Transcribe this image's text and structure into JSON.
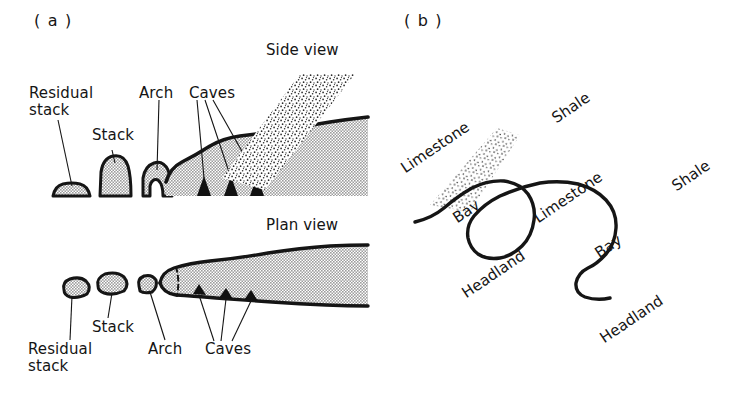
{
  "figure": {
    "background_color": "#ffffff",
    "ink_color": "#151515",
    "land_fill_color": "#b9b9b9",
    "shale_stipple_color": "#2b2b2b",
    "cave_color": "#111111"
  },
  "panels": [
    {
      "tag": "( a )",
      "title_top": "Side view",
      "title_bottom": "Plan view",
      "side_view": {
        "labels": [
          {
            "name": "residual-stack",
            "text_line1": "Residual",
            "text_line2": "stack"
          },
          {
            "name": "stack",
            "text_line1": "Stack",
            "text_line2": ""
          },
          {
            "name": "arch",
            "text_line1": "Arch",
            "text_line2": ""
          },
          {
            "name": "caves",
            "text_line1": "Caves",
            "text_line2": ""
          }
        ],
        "cave_count": 3
      },
      "plan_view": {
        "labels": [
          {
            "name": "residual-stack",
            "text_line1": "Residual",
            "text_line2": "stack"
          },
          {
            "name": "stack",
            "text_line1": "Stack",
            "text_line2": ""
          },
          {
            "name": "arch",
            "text_line1": "Arch",
            "text_line2": ""
          },
          {
            "name": "caves",
            "text_line1": "Caves",
            "text_line2": ""
          }
        ],
        "cave_count": 3
      }
    },
    {
      "tag": "( b )",
      "rock_labels": [
        {
          "name": "limestone-1",
          "text": "Limestone",
          "rotation_deg": -34
        },
        {
          "name": "shale-1",
          "text": "Shale",
          "rotation_deg": -34
        },
        {
          "name": "limestone-2",
          "text": "Limestone",
          "rotation_deg": -34
        },
        {
          "name": "shale-2",
          "text": "Shale",
          "rotation_deg": -34
        }
      ],
      "coast_labels": [
        {
          "name": "bay-1",
          "text": "Bay",
          "rotation_deg": -34
        },
        {
          "name": "headland-1",
          "text": "Headland",
          "rotation_deg": -34
        },
        {
          "name": "bay-2",
          "text": "Bay",
          "rotation_deg": -34
        },
        {
          "name": "headland-2",
          "text": "Headland",
          "rotation_deg": -34
        }
      ]
    }
  ]
}
